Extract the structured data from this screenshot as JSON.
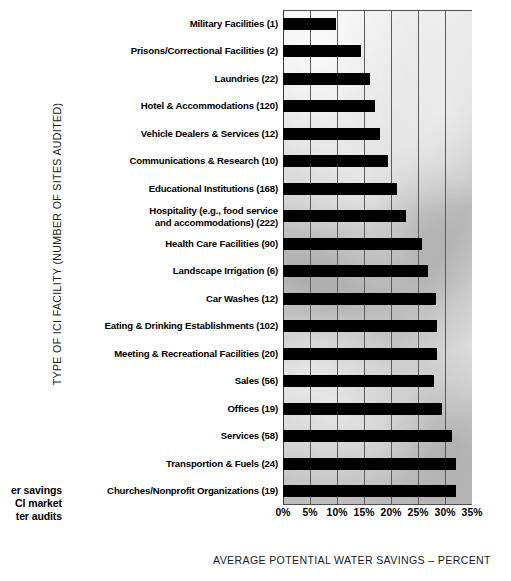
{
  "chart_data": {
    "type": "bar",
    "orientation": "horizontal",
    "title": "",
    "xlabel": "AVERAGE POTENTIAL WATER SAVINGS – PERCENT",
    "ylabel": "TYPE OF ICI FACILITY (NUMBER OF SITES AUDITED)",
    "xlim": [
      0,
      35
    ],
    "xtick_labels": [
      "0%",
      "5%",
      "10%",
      "15%",
      "20%",
      "25%",
      "30%",
      "35%"
    ],
    "xticks": [
      0,
      5,
      10,
      15,
      20,
      25,
      30,
      35
    ],
    "grid": true,
    "legend": "none",
    "bar_color": "#000000",
    "categories": [
      "Military Facilities (1)",
      "Prisons/Correctional Facilities (2)",
      "Laundries (22)",
      "Hotel & Accommodations (120)",
      "Vehicle Dealers & Services (12)",
      "Communications & Research (10)",
      "Educational Institutions (168)",
      "Hospitality (e.g., food service and accommodations) (222)",
      "Health Care Facilities (90)",
      "Landscape Irrigation (6)",
      "Car Washes (12)",
      "Eating & Drinking Establishments (102)",
      "Meeting & Recreational Facilities (20)",
      "Sales (56)",
      "Offices (19)",
      "Services (58)",
      "Transportion & Fuels (24)",
      "Churches/Nonprofit Organizations (19)"
    ],
    "values": [
      9.8,
      14.5,
      16.2,
      17.0,
      18.0,
      19.5,
      21.2,
      22.8,
      25.7,
      26.8,
      28.3,
      28.5,
      28.5,
      28.0,
      29.5,
      31.3,
      32.0,
      32.0
    ]
  },
  "category_lines": [
    [
      "Military Facilities (1)"
    ],
    [
      "Prisons/Correctional Facilities (2)"
    ],
    [
      "Laundries (22)"
    ],
    [
      "Hotel & Accommodations (120)"
    ],
    [
      "Vehicle Dealers & Services (12)"
    ],
    [
      "Communications & Research (10)"
    ],
    [
      "Educational Institutions (168)"
    ],
    [
      "Hospitality (e.g., food service",
      "and accommodations) (222)"
    ],
    [
      "Health Care Facilities (90)"
    ],
    [
      "Landscape Irrigation (6)"
    ],
    [
      "Car Washes (12)"
    ],
    [
      "Eating & Drinking Establishments (102)"
    ],
    [
      "Meeting & Recreational Facilities (20)"
    ],
    [
      "Sales (56)"
    ],
    [
      "Offices (19)"
    ],
    [
      "Services (58)"
    ],
    [
      "Transportion & Fuels (24)"
    ],
    [
      "Churches/Nonprofit Organizations (19)"
    ]
  ],
  "caption": {
    "lines": [
      "er savings",
      "CI market",
      "ter audits"
    ],
    "note": "text clipped at left page edge"
  }
}
